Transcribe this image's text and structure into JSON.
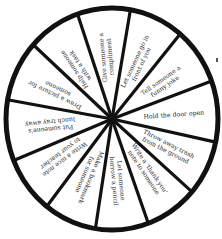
{
  "wheel": {
    "center": [
      112,
      119
    ],
    "radius_x": 106,
    "radius_y": 111,
    "rim_color": "#111111",
    "fill_color": "#ffffff",
    "text_color": "#2a2a2a",
    "spoke_angles_deg": [
      -20,
      -50,
      -80,
      -109,
      -138,
      -170,
      158,
      128,
      99,
      70,
      41,
      12
    ],
    "segments": [
      {
        "label_lines": [
          "Hold the door open"
        ],
        "angle": -4
      },
      {
        "label_lines": [
          "Tell someone a",
          "funny joke"
        ],
        "angle": -35
      },
      {
        "label_lines": [
          "Let someone go in",
          "front of you"
        ],
        "angle": -65
      },
      {
        "label_lines": [
          "Give someone a",
          "compliment"
        ],
        "angle": -95
      },
      {
        "label_lines": [
          "Help someone",
          "with a task"
        ],
        "angle": -124
      },
      {
        "label_lines": [
          "Draw a picture for",
          "someone"
        ],
        "angle": -154
      },
      {
        "label_lines": [
          "Put someone's",
          "lunch tray away"
        ],
        "angle": 174
      },
      {
        "label_lines": [
          "Write a nice note",
          "to your teacher"
        ],
        "angle": 143
      },
      {
        "label_lines": [
          "Make a bookmark",
          "for someone"
        ],
        "angle": 113
      },
      {
        "label_lines": [
          "Let someone",
          "borrow a pencil"
        ],
        "angle": 85
      },
      {
        "label_lines": [
          "Write a 'thank you'",
          "note to someone"
        ],
        "angle": 56
      },
      {
        "label_lines": [
          "Throw away trash",
          "from the ground"
        ],
        "angle": 27
      }
    ]
  }
}
